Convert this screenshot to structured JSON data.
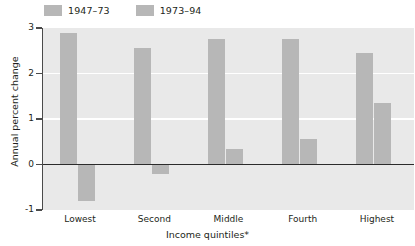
{
  "chart_data": {
    "type": "bar",
    "title": "",
    "subtitle": "",
    "xlabel": "Income quintiles*",
    "ylabel": "Annual percent change",
    "categories": [
      "Lowest",
      "Second",
      "Middle",
      "Fourth",
      "Highest"
    ],
    "series": [
      {
        "name": "1947–73",
        "values": [
          2.9,
          2.55,
          2.75,
          2.75,
          2.45
        ],
        "color": "#b7b7b7"
      },
      {
        "name": "1973–94",
        "values": [
          -0.8,
          -0.2,
          0.35,
          0.55,
          1.35
        ],
        "color": "#b7b7b7"
      }
    ],
    "ylim": [
      -1,
      3
    ],
    "yticks": [
      3,
      2,
      1,
      0,
      -1
    ],
    "ytick_labels": [
      "3",
      "2",
      "1",
      "0",
      "-1"
    ],
    "gridlines_at": [
      2,
      1
    ],
    "grid": true,
    "legend_position": "top-left",
    "plot_background": "#e9e9e9",
    "gridline_color": "#ffffff",
    "zeroline_color": "#2b2b2b",
    "axis_color": "#4a4a4a",
    "footnote_marker": "*"
  }
}
